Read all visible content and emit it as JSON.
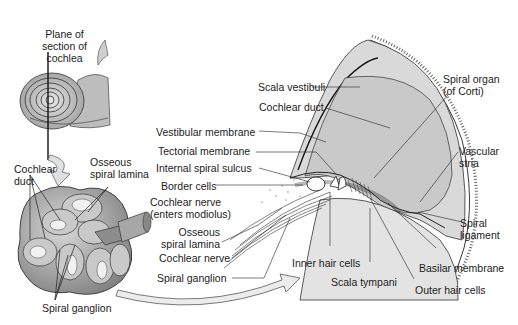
{
  "diagram": {
    "panels": {
      "cochlea_overview": {
        "labels": {
          "plane_of_section": [
            "Plane of",
            "section of",
            "cochlea"
          ]
        }
      },
      "cochlea_section": {
        "labels": {
          "cochlear_duct": [
            "Cochlear",
            "duct"
          ],
          "osseous_spiral_lamina": [
            "Osseous",
            "spiral lamina"
          ],
          "spiral_ganglion": "Spiral ganglion"
        }
      },
      "detail": {
        "labels": {
          "scala_vestibuli": "Scala vestibuli",
          "cochlear_duct": "Cochlear duct",
          "vestibular_membrane": "Vestibular membrane",
          "tectorial_membrane": "Tectorial membrane",
          "internal_spiral_sulcus": "Internal spiral sulcus",
          "border_cells": "Border cells",
          "cochlear_nerve_enters": [
            "Cochlear nerve",
            "(enters modiolus)"
          ],
          "osseous_spiral_lamina": [
            "Osseous",
            "spiral lamina"
          ],
          "cochlear_nerve": "Cochlear nerve",
          "spiral_ganglion": "Spiral ganglion",
          "inner_hair_cells": "Inner hair cells",
          "scala_tympani": "Scala tympani",
          "outer_hair_cells": "Outer hair cells",
          "basilar_membrane": "Basilar membrane",
          "spiral_ligament": [
            "Spiral",
            "ligament"
          ],
          "vascular_stria": [
            "Vascular",
            "stria"
          ],
          "spiral_organ": [
            "Spiral organ",
            "(of Corti)"
          ]
        }
      }
    }
  }
}
